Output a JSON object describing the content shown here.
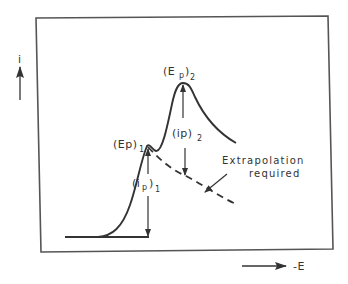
{
  "diagram": {
    "title": "",
    "type": "voltammogram-schematic",
    "colors": {
      "ink": "#333333",
      "frame": "#555555",
      "background": "#ffffff"
    },
    "axes": {
      "y_label": "i",
      "x_label": "-E",
      "y_arrow_direction": "up",
      "x_arrow_direction": "right"
    },
    "curve": {
      "style": "solid",
      "description": "Two overlapping current peaks rising from baseline"
    },
    "extrapolation": {
      "style": "dashed",
      "description": "Decay of first peak extrapolated beneath second wave"
    },
    "labels": {
      "ep1_main": "(Ep)",
      "ep1_sub": "1",
      "ep2_main": "(E",
      "ep2_p": "p",
      "ep2_close": ")",
      "ep2_sub": "2",
      "ip1_main": "(i",
      "ip1_p": "p",
      "ip1_close": ")",
      "ip1_sub": "1",
      "ip2_main": "(ip)",
      "ip2_sub": "2",
      "note_line1": "Extrapolation",
      "note_line2": "required"
    }
  }
}
